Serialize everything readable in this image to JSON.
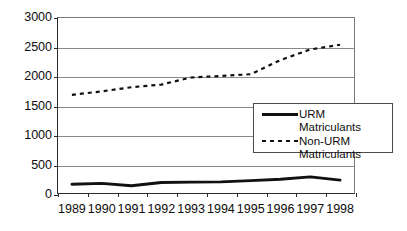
{
  "chart_data": {
    "type": "line",
    "title": "",
    "xlabel": "",
    "ylabel": "",
    "categories": [
      "1989",
      "1990",
      "1991",
      "1992",
      "1993",
      "1994",
      "1995",
      "1996",
      "1997",
      "1998"
    ],
    "series": [
      {
        "name": "URM Matriculants",
        "style": "solid",
        "color": "#111111",
        "values": [
          165,
          180,
          140,
          195,
          200,
          205,
          225,
          250,
          290,
          235
        ]
      },
      {
        "name": "Non-URM Matriculants",
        "style": "dashed",
        "color": "#111111",
        "values": [
          1680,
          1740,
          1810,
          1855,
          1975,
          2000,
          2030,
          2270,
          2450,
          2530
        ]
      }
    ],
    "ylim": [
      0,
      3000
    ],
    "yticks": [
      0,
      500,
      1000,
      1500,
      2000,
      2500,
      3000
    ],
    "ytick_labels": [
      "0",
      "500",
      "1000",
      "1500",
      "2000",
      "2500",
      "3000"
    ],
    "grid": true,
    "legend_position": "inside-right"
  },
  "legend": {
    "entries": [
      {
        "label": "URM Matriculants",
        "marker": "solid-line-swatch"
      },
      {
        "label": "Non-URM\nMatriculants",
        "marker": "dashed-line-swatch"
      }
    ]
  }
}
